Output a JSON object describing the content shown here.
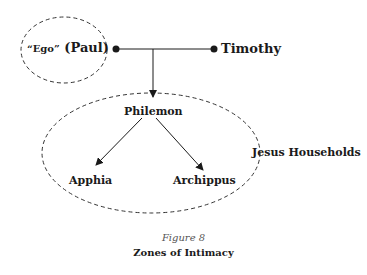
{
  "diagram": {
    "nodes": {
      "ego": {
        "quote": "“Ego”",
        "name": "(Paul)"
      },
      "timothy": "Timothy",
      "philemon": "Philemon",
      "apphia": "Apphia",
      "archippus": "Archippus"
    },
    "zones": {
      "outer_label": "Jesus Households"
    },
    "edges": [
      {
        "from": "Paul",
        "to": "Timothy",
        "type": "line"
      },
      {
        "from": "Paul-Timothy link",
        "to": "Philemon",
        "type": "arrow"
      },
      {
        "from": "Philemon",
        "to": "Apphia",
        "type": "arrow"
      },
      {
        "from": "Philemon",
        "to": "Archippus",
        "type": "arrow"
      }
    ],
    "colors": {
      "stroke": "#1a1a1a",
      "background": "#ffffff"
    }
  },
  "caption": {
    "figure_number": "Figure 8",
    "title": "Zones of Intimacy"
  }
}
